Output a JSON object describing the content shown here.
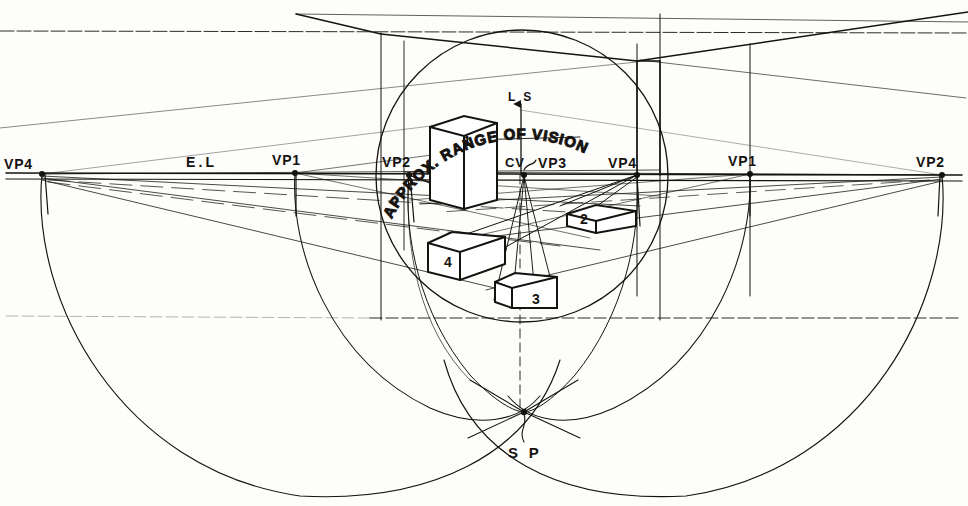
{
  "diagram": {
    "type": "technical-perspective-drawing",
    "ink_color": "#15130f",
    "paper_color": "#fdfdfc",
    "curved_label": "APPROX. RANGE OF VISION",
    "eye_level_label": "E.L",
    "line_of_sight_label": "L S",
    "center_of_vision_label": "CV",
    "station_point_label": "S P"
  },
  "vanishing_points": [
    {
      "id": "vp4-left",
      "label": "VP4",
      "x": 42,
      "y": 174,
      "label_x": 4,
      "label_y": 156
    },
    {
      "id": "vp1-left",
      "label": "VP1",
      "x": 295,
      "y": 173,
      "label_x": 272,
      "label_y": 152
    },
    {
      "id": "vp2-left",
      "label": "VP2",
      "x": 409,
      "y": 175,
      "label_x": 382,
      "label_y": 154
    },
    {
      "id": "vp3-center",
      "label": "VP3",
      "x": 524,
      "y": 175,
      "label_x": 538,
      "label_y": 155
    },
    {
      "id": "vp4-right",
      "label": "VP4",
      "x": 637,
      "y": 175,
      "label_x": 608,
      "label_y": 155
    },
    {
      "id": "vp1-right",
      "label": "VP1",
      "x": 750,
      "y": 174,
      "label_x": 728,
      "label_y": 153
    },
    {
      "id": "vp2-right",
      "label": "VP2",
      "x": 942,
      "y": 175,
      "label_x": 916,
      "label_y": 154
    }
  ],
  "key_points": {
    "station_point": {
      "label": "S P",
      "x": 524,
      "y": 412,
      "label_x": 510,
      "label_y": 447
    },
    "center_of_vision": {
      "label": "CV",
      "x": 524,
      "y": 175,
      "label_x": 506,
      "label_y": 155
    },
    "line_of_sight": {
      "label": "L S",
      "tip_x": 521,
      "tip_y": 102,
      "label_x": 508,
      "label_y": 91
    },
    "eye_level": {
      "label": "E.L",
      "y": 172,
      "label_x": 186,
      "label_y": 154
    }
  },
  "vision_circle": {
    "cx": 522,
    "cy": 176,
    "r": 146
  },
  "ground_arcs": [
    {
      "id": "left-big-arc",
      "cx": 492,
      "cy": 175,
      "rx": 450,
      "ry": 330
    },
    {
      "id": "right-big-arc",
      "cx": 492,
      "cy": 175,
      "rx": 450,
      "ry": 330
    }
  ],
  "blocks": [
    {
      "id": "block-1",
      "label": "1",
      "label_x": 463,
      "label_y": 140,
      "kind": "tall-vertical-prism"
    },
    {
      "id": "block-2",
      "label": "2",
      "label_x": 581,
      "label_y": 218,
      "kind": "flat-slab-right"
    },
    {
      "id": "block-3",
      "label": "3",
      "label_x": 535,
      "label_y": 299,
      "kind": "low-block-center"
    },
    {
      "id": "block-4",
      "label": "4",
      "label_x": 447,
      "label_y": 262,
      "kind": "flat-slab-left"
    }
  ],
  "counts": {
    "vanishing_points": 7,
    "blocks": 4,
    "major_arcs": 2
  }
}
